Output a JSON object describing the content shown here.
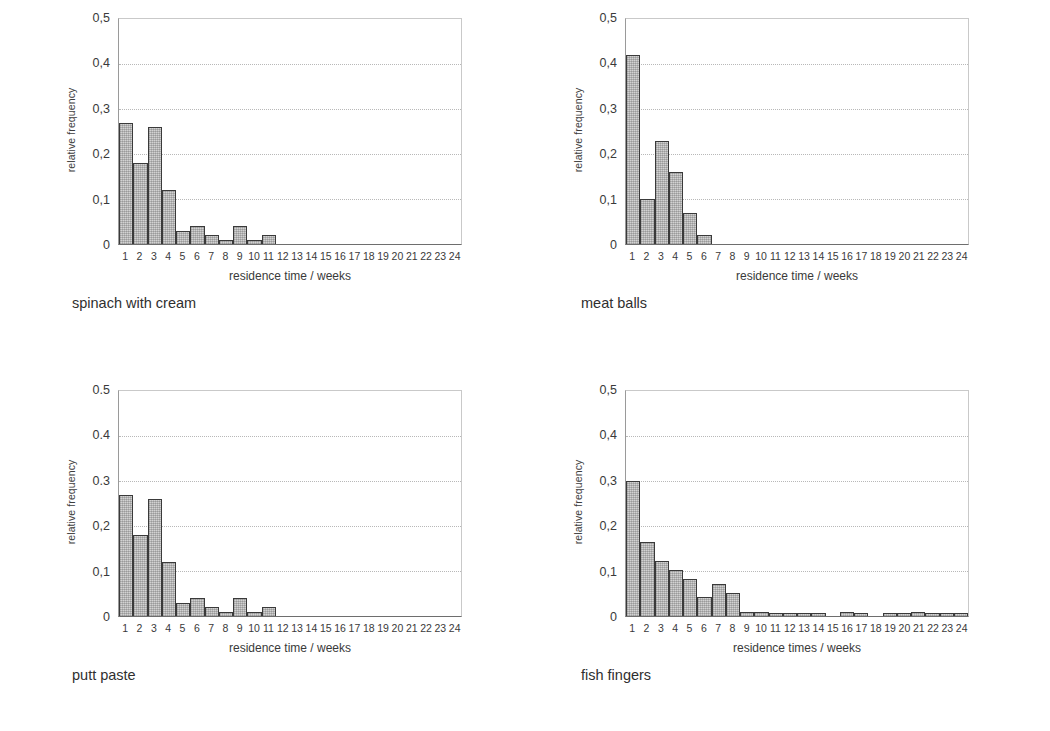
{
  "figure": {
    "panel_count": 4
  },
  "common": {
    "ylabel": "relative frequency",
    "xtick_labels": [
      "1",
      "2",
      "3",
      "4",
      "5",
      "6",
      "7",
      "8",
      "9",
      "10",
      "11",
      "12",
      "13",
      "14",
      "15",
      "16",
      "17",
      "18",
      "19",
      "20",
      "21",
      "22",
      "23",
      "24"
    ],
    "gridline_values": [
      0.1,
      0.2,
      0.3,
      0.4
    ],
    "bar_fill_color": "#d2d2d2",
    "bar_border_color": "#3a3a3a",
    "gridline_color": "#b8b8b8",
    "axis_color": "#6e6e6e"
  },
  "chart_data": [
    {
      "id": "spinach-with-cream",
      "type": "bar",
      "title": "spinach with cream",
      "caption": "spinach with cream",
      "xlabel": "residence time / weeks",
      "ylabel": "relative frequency",
      "ylim": [
        0,
        0.5
      ],
      "xlim": [
        1,
        24
      ],
      "grid": true,
      "ytick_labels": [
        "0,5",
        "0,4",
        "0,3",
        "0,2",
        "0,1",
        "0"
      ],
      "ytick_values": [
        0.5,
        0.4,
        0.3,
        0.2,
        0.1,
        0
      ],
      "categories": [
        "1",
        "2",
        "3",
        "4",
        "5",
        "6",
        "7",
        "8",
        "9",
        "10",
        "11",
        "12",
        "13",
        "14",
        "15",
        "16",
        "17",
        "18",
        "19",
        "20",
        "21",
        "22",
        "23",
        "24"
      ],
      "values": [
        0.27,
        0.18,
        0.26,
        0.12,
        0.03,
        0.04,
        0.02,
        0.01,
        0.04,
        0.01,
        0.02,
        0,
        0,
        0,
        0,
        0,
        0,
        0,
        0,
        0,
        0,
        0,
        0,
        0
      ]
    },
    {
      "id": "meat-balls",
      "type": "bar",
      "title": "meat balls",
      "caption": "meat balls",
      "xlabel": "residence time / weeks",
      "ylabel": "relative frequency",
      "ylim": [
        0,
        0.5
      ],
      "xlim": [
        1,
        24
      ],
      "grid": true,
      "ytick_labels": [
        "0,5",
        "0,4",
        "0,3",
        "0,2",
        "0,1",
        "0"
      ],
      "ytick_values": [
        0.5,
        0.4,
        0.3,
        0.2,
        0.1,
        0
      ],
      "categories": [
        "1",
        "2",
        "3",
        "4",
        "5",
        "6",
        "7",
        "8",
        "9",
        "10",
        "11",
        "12",
        "13",
        "14",
        "15",
        "16",
        "17",
        "18",
        "19",
        "20",
        "21",
        "22",
        "23",
        "24"
      ],
      "values": [
        0.42,
        0.1,
        0.23,
        0.16,
        0.07,
        0.02,
        0,
        0,
        0,
        0,
        0,
        0,
        0,
        0,
        0,
        0,
        0,
        0,
        0,
        0,
        0,
        0,
        0,
        0
      ]
    },
    {
      "id": "putt-paste",
      "type": "bar",
      "title": "putt paste",
      "caption": "putt paste",
      "xlabel": "residence time / weeks",
      "ylabel": "relative frequency",
      "ylim": [
        0,
        0.5
      ],
      "xlim": [
        1,
        24
      ],
      "grid": true,
      "ytick_labels": [
        "0.5",
        "0.4",
        "0.3",
        "0,2",
        "0,1",
        "0"
      ],
      "ytick_values": [
        0.5,
        0.4,
        0.3,
        0.2,
        0.1,
        0
      ],
      "categories": [
        "1",
        "2",
        "3",
        "4",
        "5",
        "6",
        "7",
        "8",
        "9",
        "10",
        "11",
        "12",
        "13",
        "14",
        "15",
        "16",
        "17",
        "18",
        "19",
        "20",
        "21",
        "22",
        "23",
        "24"
      ],
      "values": [
        0.27,
        0.18,
        0.26,
        0.12,
        0.03,
        0.04,
        0.02,
        0.01,
        0.04,
        0.01,
        0.02,
        0,
        0,
        0,
        0,
        0,
        0,
        0,
        0,
        0,
        0,
        0,
        0,
        0
      ]
    },
    {
      "id": "fish-fingers",
      "type": "bar",
      "title": "fish fingers",
      "caption": "fish fingers",
      "xlabel": "residence times / weeks",
      "ylabel": "relative frequency",
      "ylim": [
        0,
        0.5
      ],
      "xlim": [
        1,
        24
      ],
      "grid": true,
      "ytick_labels": [
        "0,5",
        "0,4",
        "0,3",
        "0,2",
        "0,1",
        "0"
      ],
      "ytick_values": [
        0.5,
        0.4,
        0.3,
        0.2,
        0.1,
        0
      ],
      "categories": [
        "1",
        "2",
        "3",
        "4",
        "5",
        "6",
        "7",
        "8",
        "9",
        "10",
        "11",
        "12",
        "13",
        "14",
        "15",
        "16",
        "17",
        "18",
        "19",
        "20",
        "21",
        "22",
        "23",
        "24"
      ],
      "values": [
        0.3,
        0.165,
        0.122,
        0.102,
        0.082,
        0.042,
        0.072,
        0.052,
        0.009,
        0.009,
        0.004,
        0.003,
        0.003,
        0.003,
        0.0,
        0.008,
        0.003,
        0.0,
        0.003,
        0.003,
        0.008,
        0.003,
        0.003,
        0.003
      ]
    }
  ]
}
